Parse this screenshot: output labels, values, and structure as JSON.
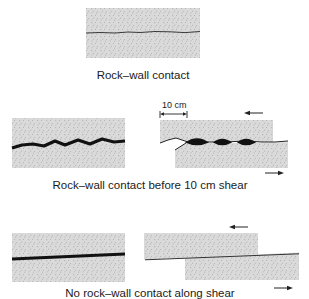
{
  "figure": {
    "panels": [
      {
        "id": "panel-1",
        "caption": "Rock–wall contact",
        "description": "Single rock block with thin irregular contact line"
      },
      {
        "id": "panel-2",
        "caption": "Rock–wall contact before 10 cm shear",
        "scale_label": "10 cm",
        "description": "Left: thick wavy contact; Right: sheared blocks with lens-shaped contact fillings"
      },
      {
        "id": "panel-3",
        "caption": "No rock–wall contact along shear",
        "description": "Left: thick planar filling; Right: sheared blocks along planar contact"
      }
    ],
    "shear_arrows": {
      "upper": "left",
      "lower": "right"
    },
    "colors": {
      "rock_fill": "#d9d9d9",
      "speckle": "#9a9a9a",
      "contact_line": "#222222",
      "text": "#1a1a1a"
    }
  }
}
